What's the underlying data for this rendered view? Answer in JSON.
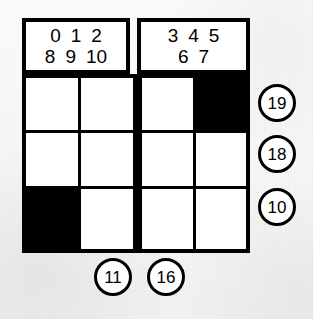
{
  "puzzle": {
    "type": "number-grid-puzzle",
    "grid": {
      "columns": 4,
      "rows": 3,
      "thick_divider_after_column": 2,
      "cells": [
        [
          {
            "state": "white",
            "value": ""
          },
          {
            "state": "white",
            "value": ""
          },
          {
            "state": "white",
            "value": ""
          },
          {
            "state": "black",
            "value": ""
          }
        ],
        [
          {
            "state": "white",
            "value": ""
          },
          {
            "state": "white",
            "value": ""
          },
          {
            "state": "white",
            "value": ""
          },
          {
            "state": "white",
            "value": ""
          }
        ],
        [
          {
            "state": "black",
            "value": ""
          },
          {
            "state": "white",
            "value": ""
          },
          {
            "state": "white",
            "value": ""
          },
          {
            "state": "white",
            "value": ""
          }
        ]
      ]
    },
    "header": {
      "left_box": {
        "row1": [
          "0",
          "1",
          "2"
        ],
        "row2": [
          "8",
          "9",
          "10"
        ]
      },
      "right_box": {
        "row1": [
          "3",
          "4",
          "5"
        ],
        "row2": [
          "6",
          "7"
        ]
      }
    },
    "row_clues": [
      {
        "label": "19",
        "row": 1
      },
      {
        "label": "18",
        "row": 2
      },
      {
        "label": "10",
        "row": 3
      }
    ],
    "column_clues": [
      {
        "label": "11",
        "column": 2
      },
      {
        "label": "16",
        "column": 3
      }
    ],
    "colors": {
      "ink": "#000000",
      "cell_fill": "#ffffff",
      "paper": "#f7f6f4"
    }
  }
}
